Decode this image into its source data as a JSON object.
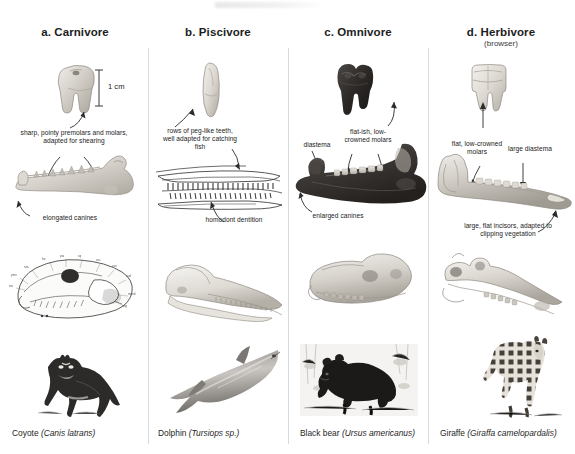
{
  "figure": {
    "scale_bar": {
      "label": "1 cm"
    }
  },
  "columns": [
    {
      "id": "carnivore",
      "letter": "a.",
      "header": "a. Carnivore",
      "subheader": "",
      "species_common": "Coyote",
      "species_latin": "(Canis latrans)",
      "tooth_label": "carnivore-tooth",
      "jaw_label": "coyote-jaw",
      "skull_label": "coyote-skull-illustration",
      "animal_label": "coyote-photo",
      "annotations": [
        {
          "name": "premolar-molar-annotation",
          "text": "sharp, pointy premolars and molars, adapted for shearing"
        },
        {
          "name": "canine-annotation",
          "text": "elongated canines"
        }
      ]
    },
    {
      "id": "piscivore",
      "letter": "b.",
      "header": "b. Piscivore",
      "subheader": "",
      "species_common": "Dolphin",
      "species_latin": "(Tursiops sp.)",
      "tooth_label": "piscivore-tooth",
      "jaw_label": "dolphin-jaw",
      "skull_label": "dolphin-skull",
      "animal_label": "dolphin-photo",
      "annotations": [
        {
          "name": "peg-teeth-annotation",
          "text": "rows of peg-like teeth, well adapted for catching fish"
        },
        {
          "name": "homodont-annotation",
          "text": "homodont dentition"
        }
      ]
    },
    {
      "id": "omnivore",
      "letter": "c.",
      "header": "c. Omnivore",
      "subheader": "",
      "species_common": "Black bear",
      "species_latin": "(Ursus americanus)",
      "tooth_label": "omnivore-tooth",
      "jaw_label": "black-bear-jaw",
      "skull_label": "black-bear-skull",
      "animal_label": "black-bear-photo",
      "annotations": [
        {
          "name": "molar-annotation",
          "text": "flat-ish, low-crowned molars"
        },
        {
          "name": "diastema-annotation",
          "text": "diastema"
        },
        {
          "name": "enlarged-canines-annotation",
          "text": "enlarged canines"
        }
      ]
    },
    {
      "id": "herbivore",
      "letter": "d.",
      "header": "d. Herbivore",
      "subheader": "(browser)",
      "species_common": "Giraffe",
      "species_latin": "(Giraffa camelopardalis)",
      "tooth_label": "herbivore-tooth",
      "jaw_label": "giraffe-jaw",
      "skull_label": "giraffe-skull",
      "animal_label": "giraffe-photo",
      "annotations": [
        {
          "name": "flat-molar-annotation",
          "text": "flat, low-crowned molars"
        },
        {
          "name": "large-diastema-annotation",
          "text": "large diastema"
        },
        {
          "name": "incisor-annotation",
          "text": "large, flat incisors, adapted to clipping vegetation"
        }
      ]
    }
  ],
  "colors": {
    "bone_light": "#e8e6e1",
    "bone_mid": "#c9c5bd",
    "bone_dark": "#9d9890",
    "dark_tooth": "#2e2b29",
    "divider": "#d7d9dc",
    "text": "#1d1d1d"
  }
}
